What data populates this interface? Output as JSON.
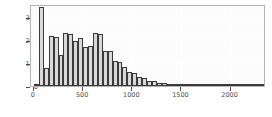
{
  "chart_data": {
    "type": "bar",
    "title": "",
    "subtitle": "",
    "xlabel": "",
    "ylabel": "",
    "xlim": [
      -30,
      2360
    ],
    "ylim": [
      0,
      355
    ],
    "grid": true,
    "legend": null,
    "binwidth": 50,
    "x_ticks": [
      {
        "value": 0,
        "label": "0"
      },
      {
        "value": 500,
        "label": "500"
      },
      {
        "value": 1000,
        "label": "1000"
      },
      {
        "value": 1500,
        "label": "1500"
      },
      {
        "value": 2000,
        "label": "2000"
      }
    ],
    "y_ticks": [
      {
        "value": 0,
        "label": "0"
      },
      {
        "value": 100,
        "label": "100"
      },
      {
        "value": 200,
        "label": "200"
      },
      {
        "value": 300,
        "label": "300"
      }
    ],
    "bins": [
      {
        "x0": 0,
        "x1": 50,
        "count": 6
      },
      {
        "x0": 50,
        "x1": 100,
        "count": 340
      },
      {
        "x0": 100,
        "x1": 150,
        "count": 78
      },
      {
        "x0": 150,
        "x1": 200,
        "count": 218
      },
      {
        "x0": 200,
        "x1": 250,
        "count": 212
      },
      {
        "x0": 250,
        "x1": 300,
        "count": 135
      },
      {
        "x0": 300,
        "x1": 350,
        "count": 228
      },
      {
        "x0": 350,
        "x1": 400,
        "count": 226
      },
      {
        "x0": 400,
        "x1": 450,
        "count": 196
      },
      {
        "x0": 450,
        "x1": 500,
        "count": 210
      },
      {
        "x0": 500,
        "x1": 550,
        "count": 168
      },
      {
        "x0": 550,
        "x1": 600,
        "count": 172
      },
      {
        "x0": 600,
        "x1": 650,
        "count": 228
      },
      {
        "x0": 650,
        "x1": 700,
        "count": 226
      },
      {
        "x0": 700,
        "x1": 750,
        "count": 152
      },
      {
        "x0": 750,
        "x1": 800,
        "count": 150
      },
      {
        "x0": 800,
        "x1": 850,
        "count": 110
      },
      {
        "x0": 850,
        "x1": 900,
        "count": 106
      },
      {
        "x0": 900,
        "x1": 950,
        "count": 82
      },
      {
        "x0": 950,
        "x1": 1000,
        "count": 60
      },
      {
        "x0": 1000,
        "x1": 1050,
        "count": 58
      },
      {
        "x0": 1050,
        "x1": 1100,
        "count": 38
      },
      {
        "x0": 1100,
        "x1": 1150,
        "count": 36
      },
      {
        "x0": 1150,
        "x1": 1200,
        "count": 22
      },
      {
        "x0": 1200,
        "x1": 1250,
        "count": 20
      },
      {
        "x0": 1250,
        "x1": 1300,
        "count": 12
      },
      {
        "x0": 1300,
        "x1": 1350,
        "count": 11
      },
      {
        "x0": 1350,
        "x1": 1400,
        "count": 9
      },
      {
        "x0": 1400,
        "x1": 1450,
        "count": 8
      },
      {
        "x0": 1450,
        "x1": 1500,
        "count": 6
      },
      {
        "x0": 1500,
        "x1": 1550,
        "count": 5
      },
      {
        "x0": 1550,
        "x1": 1600,
        "count": 5
      },
      {
        "x0": 1600,
        "x1": 1650,
        "count": 4
      },
      {
        "x0": 1650,
        "x1": 1700,
        "count": 3
      },
      {
        "x0": 1700,
        "x1": 1750,
        "count": 5
      },
      {
        "x0": 1750,
        "x1": 1800,
        "count": 4
      },
      {
        "x0": 1800,
        "x1": 1850,
        "count": 3
      },
      {
        "x0": 1850,
        "x1": 1900,
        "count": 4
      },
      {
        "x0": 1900,
        "x1": 1950,
        "count": 5
      },
      {
        "x0": 1950,
        "x1": 2000,
        "count": 5
      },
      {
        "x0": 2000,
        "x1": 2050,
        "count": 3
      },
      {
        "x0": 2050,
        "x1": 2100,
        "count": 2
      },
      {
        "x0": 2100,
        "x1": 2150,
        "count": 2
      },
      {
        "x0": 2150,
        "x1": 2200,
        "count": 3
      },
      {
        "x0": 2200,
        "x1": 2250,
        "count": 4
      },
      {
        "x0": 2250,
        "x1": 2300,
        "count": 4
      },
      {
        "x0": 2300,
        "x1": 2350,
        "count": 3
      }
    ]
  },
  "style": {
    "panel_background": "#fcfcfc",
    "panel_border": "#b4b4b4",
    "grid_color": "#ffffff",
    "bar_fill": "#d9d9d9",
    "bar_outline": "#3a3a3a",
    "axis_text": "#4d4d4d"
  }
}
